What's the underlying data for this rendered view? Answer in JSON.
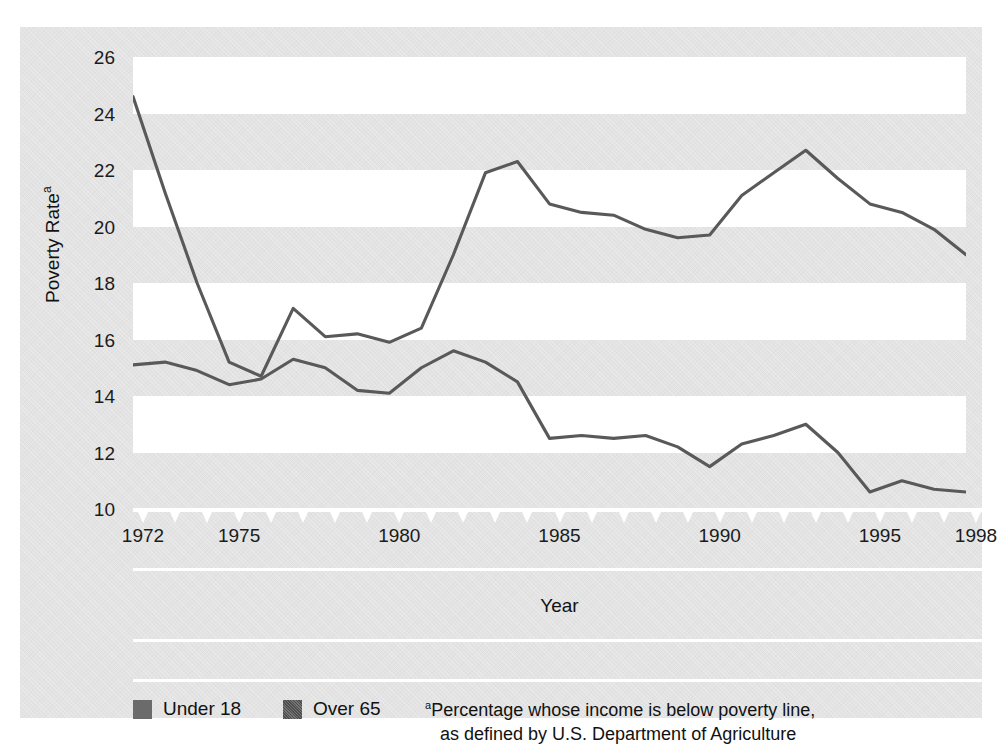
{
  "chart_data": {
    "type": "line",
    "title": "",
    "xlabel": "Year",
    "ylabel": "Poverty Rate",
    "ylabel_superscript": "a",
    "xlim": [
      1972,
      1998
    ],
    "ylim": [
      10,
      26
    ],
    "ytick_values": [
      10,
      12,
      14,
      16,
      18,
      20,
      22,
      24,
      26
    ],
    "xtick_values": [
      1972,
      1973,
      1974,
      1975,
      1976,
      1977,
      1978,
      1979,
      1980,
      1981,
      1982,
      1983,
      1984,
      1985,
      1986,
      1987,
      1988,
      1989,
      1990,
      1991,
      1992,
      1993,
      1994,
      1995,
      1996,
      1997,
      1998
    ],
    "xtick_labels_shown": [
      {
        "value": 1972,
        "label": "1972"
      },
      {
        "value": 1975,
        "label": "1975"
      },
      {
        "value": 1980,
        "label": "1980"
      },
      {
        "value": 1985,
        "label": "1985"
      },
      {
        "value": 1990,
        "label": "1990"
      },
      {
        "value": 1995,
        "label": "1995"
      },
      {
        "value": 1998,
        "label": "1998"
      }
    ],
    "grid": "horizontal-alternating-bands",
    "legend_position": "bottom-left",
    "x": [
      1972,
      1973,
      1974,
      1975,
      1976,
      1977,
      1978,
      1979,
      1980,
      1981,
      1982,
      1983,
      1984,
      1985,
      1986,
      1987,
      1988,
      1989,
      1990,
      1991,
      1992,
      1993,
      1994,
      1995,
      1996,
      1997,
      1998
    ],
    "series": [
      {
        "name": "Under 18",
        "color": "#595959",
        "swatch": "solid",
        "values": [
          15.1,
          15.2,
          14.9,
          14.4,
          14.6,
          15.3,
          15.0,
          14.2,
          14.1,
          15.0,
          15.6,
          15.2,
          14.5,
          12.5,
          12.6,
          12.5,
          12.6,
          12.2,
          11.5,
          12.3,
          12.6,
          13.0,
          12.0,
          10.6,
          11.0,
          10.7,
          10.6
        ]
      },
      {
        "name": "Over 65",
        "color": "#595959",
        "swatch": "hatched",
        "values": [
          24.6,
          21.2,
          18.0,
          15.2,
          14.7,
          17.1,
          16.1,
          16.2,
          15.9,
          16.4,
          19.0,
          21.9,
          22.3,
          20.8,
          20.5,
          20.4,
          19.9,
          19.6,
          19.7,
          21.1,
          21.9,
          22.7,
          21.7,
          20.8,
          20.5,
          19.9,
          19.0
        ]
      }
    ],
    "footnote": {
      "marker": "a",
      "line1": "Percentage whose income is below poverty line,",
      "line2": "as defined by U.S. Department of Agriculture"
    }
  },
  "figure": {
    "background_color": "#e3e3e3",
    "band_color": "#ffffff",
    "line_color": "#595959",
    "text_color": "#111111",
    "tick_marker_color": "#ffffff"
  }
}
